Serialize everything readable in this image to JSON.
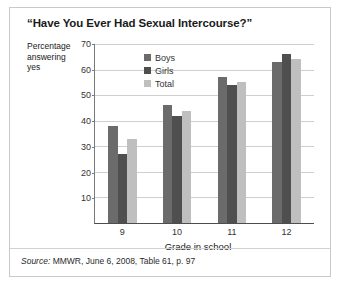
{
  "figure": {
    "title": "“Have You Ever Had Sexual Intercourse?”",
    "source_prefix": "Source:",
    "source_text": " MMWR, June 6, 2008, Table 61, p. 97"
  },
  "axis": {
    "ylabel_line1": "Percentage",
    "ylabel_line2": "answering",
    "ylabel_line3": "yes",
    "xlabel": "Grade in school"
  },
  "legend": {
    "items": [
      {
        "label": "Boys",
        "color": "#6b6b6b"
      },
      {
        "label": "Girls",
        "color": "#4f4f4f"
      },
      {
        "label": "Total",
        "color": "#bfbfbf"
      }
    ]
  },
  "chart_data": {
    "type": "bar",
    "title": "“Have You Ever Had Sexual Intercourse?”",
    "xlabel": "Grade in school",
    "ylabel": "Percentage answering yes",
    "categories": [
      "9",
      "10",
      "11",
      "12"
    ],
    "series": [
      {
        "name": "Boys",
        "color": "#6b6b6b",
        "values": [
          38,
          46,
          57,
          63
        ]
      },
      {
        "name": "Girls",
        "color": "#4f4f4f",
        "values": [
          27,
          42,
          54,
          66
        ]
      },
      {
        "name": "Total",
        "color": "#bfbfbf",
        "values": [
          33,
          44,
          55,
          64
        ]
      }
    ],
    "ylim": [
      0,
      70
    ],
    "yticks": [
      10,
      20,
      30,
      40,
      50,
      60,
      70
    ],
    "ytick_labels": [
      "10",
      "20",
      "30",
      "40",
      "50",
      "60",
      "70"
    ],
    "grid": true,
    "grid_axis": "y",
    "legend_position": "top-center",
    "source": "Source: MMWR, June 6, 2008, Table 61, p. 97"
  }
}
